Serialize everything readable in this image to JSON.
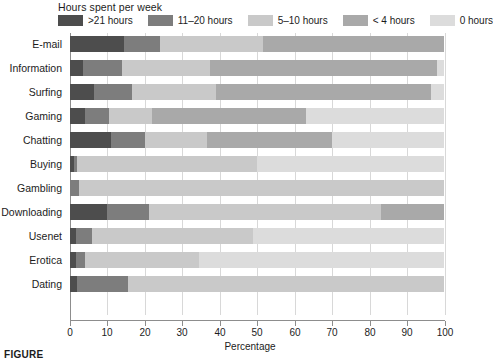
{
  "legend": {
    "title": "Hours spent per week",
    "items": [
      {
        "label": ">21 hours",
        "color": "#4d4d4d"
      },
      {
        "label": "11–20 hours",
        "color": "#7d7d7d"
      },
      {
        "label": "5–10 hours",
        "color": "#c9c9c9"
      },
      {
        "label": "< 4 hours",
        "color": "#a9a9a9"
      },
      {
        "label": "0 hours",
        "color": "#dcdcdc"
      }
    ]
  },
  "axis": {
    "x_title": "Percentage",
    "x_ticks": [
      "0",
      "10",
      "20",
      "30",
      "40",
      "50",
      "60",
      "70",
      "80",
      "90",
      "100"
    ]
  },
  "caption": "FIGURE",
  "chart_data": {
    "type": "bar",
    "orientation": "horizontal",
    "stacked": true,
    "title": "Hours spent per week",
    "xlabel": "Percentage",
    "ylabel": "",
    "xlim": [
      0,
      100
    ],
    "grid": true,
    "legend_position": "top",
    "categories": [
      "E-mail",
      "Information",
      "Surfing",
      "Gaming",
      "Chatting",
      "Buying",
      "Gambling",
      "Downloading",
      "Usenet",
      "Erotica",
      "Dating"
    ],
    "series": [
      {
        "name": ">21 hours",
        "color": "#4d4d4d",
        "values": [
          14.5,
          3.5,
          6.5,
          4.0,
          11.0,
          1.0,
          0.0,
          10.0,
          1.5,
          1.5,
          2.0
        ]
      },
      {
        "name": "11–20 hours",
        "color": "#7d7d7d",
        "values": [
          9.5,
          10.5,
          10.0,
          6.5,
          9.0,
          1.0,
          2.5,
          11.0,
          4.5,
          2.5,
          13.5
        ]
      },
      {
        "name": "5–10 hours",
        "color": "#c9c9c9",
        "values": [
          27.5,
          23.5,
          22.5,
          11.5,
          16.5,
          48.0,
          97.5,
          62.0,
          43.0,
          30.5,
          84.5
        ]
      },
      {
        "name": "< 4 hours",
        "color": "#a9a9a9",
        "values": [
          48.5,
          60.5,
          57.5,
          41.0,
          33.5,
          0.0,
          0.0,
          17.0,
          0.0,
          0.0,
          0.0
        ]
      },
      {
        "name": "0 hours",
        "color": "#dcdcdc",
        "values": [
          0.0,
          2.0,
          3.5,
          37.0,
          30.0,
          50.0,
          0.0,
          0.0,
          51.0,
          65.5,
          0.0
        ]
      }
    ]
  }
}
